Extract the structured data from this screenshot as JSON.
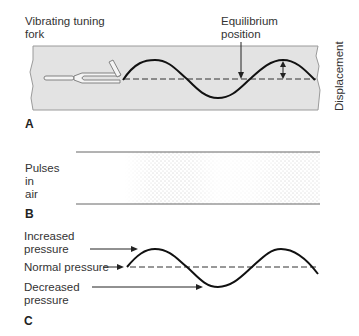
{
  "panel_a": {
    "letter": "A",
    "fork_label": "Vibrating tuning\nfork",
    "equilibrium_label": "Equilibrium\nposition",
    "displacement_label": "Displacement",
    "band_color": "#e3e3e3",
    "wave_color": "#111111"
  },
  "panel_b": {
    "letter": "B",
    "label": "Pulses\nin\nair"
  },
  "panel_c": {
    "letter": "C",
    "increased_label": "Increased\npressure",
    "normal_label": "Normal pressure",
    "decreased_label": "Decreased\npressure"
  }
}
